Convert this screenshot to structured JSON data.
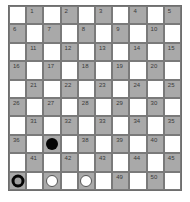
{
  "game": "draughts-10x10",
  "colors": {
    "light_square": "#ffffff",
    "dark_square": "#a9a9a9",
    "grid_line": "#7a7a7a",
    "label": "#3a3a3a",
    "black_piece": "#050505",
    "white_piece": "#ffffff"
  },
  "board": {
    "rows": 10,
    "cols": 10,
    "squares": [
      {
        "num": "1"
      },
      {
        "num": "2"
      },
      {
        "num": "3"
      },
      {
        "num": "4"
      },
      {
        "num": "5"
      },
      {
        "num": "6"
      },
      {
        "num": "7"
      },
      {
        "num": "8"
      },
      {
        "num": "9"
      },
      {
        "num": "10"
      },
      {
        "num": "11"
      },
      {
        "num": "12"
      },
      {
        "num": "13"
      },
      {
        "num": "14"
      },
      {
        "num": "15"
      },
      {
        "num": "16"
      },
      {
        "num": "17"
      },
      {
        "num": "18"
      },
      {
        "num": "19"
      },
      {
        "num": "20"
      },
      {
        "num": "21"
      },
      {
        "num": "22"
      },
      {
        "num": "23"
      },
      {
        "num": "24"
      },
      {
        "num": "25"
      },
      {
        "num": "26"
      },
      {
        "num": "27"
      },
      {
        "num": "28"
      },
      {
        "num": "29"
      },
      {
        "num": "30"
      },
      {
        "num": "31"
      },
      {
        "num": "32"
      },
      {
        "num": "33"
      },
      {
        "num": "34"
      },
      {
        "num": "35"
      },
      {
        "num": "36"
      },
      {
        "num": "37"
      },
      {
        "num": "38"
      },
      {
        "num": "39"
      },
      {
        "num": "40"
      },
      {
        "num": "41"
      },
      {
        "num": "42"
      },
      {
        "num": "43"
      },
      {
        "num": "44"
      },
      {
        "num": "45"
      },
      {
        "num": "46"
      },
      {
        "num": "47"
      },
      {
        "num": "48"
      },
      {
        "num": "49"
      },
      {
        "num": "50"
      }
    ]
  },
  "pieces": [
    {
      "square": 37,
      "type": "black"
    },
    {
      "square": 46,
      "type": "black-ring"
    },
    {
      "square": 47,
      "type": "white"
    },
    {
      "square": 48,
      "type": "white"
    }
  ]
}
